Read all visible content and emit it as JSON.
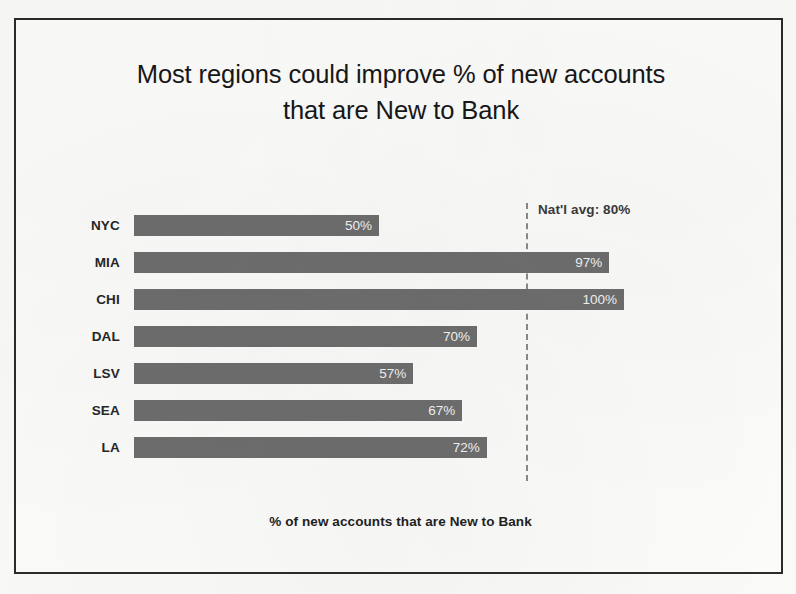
{
  "slide": {
    "title_line1": "Most regions could improve % of new accounts",
    "title_line2": "that are New to Bank",
    "frame_color": "#2b2b2b",
    "background_color": "#fdfdfc"
  },
  "annotation": {
    "avg_label": "Nat'l avg: 80%",
    "avg_value": 80,
    "line_style": "dashed",
    "line_color": "#8a8a8a"
  },
  "chart_data": {
    "type": "bar",
    "orientation": "horizontal",
    "title": "Most regions could improve % of new accounts that are New to Bank",
    "xlabel": "% of new accounts that are New to Bank",
    "ylabel": "",
    "categories": [
      "NYC",
      "MIA",
      "CHI",
      "DAL",
      "LSV",
      "SEA",
      "LA"
    ],
    "values": [
      50,
      97,
      100,
      70,
      57,
      67,
      72
    ],
    "value_labels": [
      "50%",
      "97%",
      "100%",
      "70%",
      "57%",
      "67%",
      "72%"
    ],
    "xlim": [
      0,
      100
    ],
    "grid": false,
    "legend": null,
    "bar_color": "#6e6e6e",
    "value_label_color": "#f4f4f4",
    "annotations": [
      {
        "type": "reference-line",
        "label": "Nat'l avg: 80%",
        "value": 80,
        "style": "dashed"
      }
    ]
  }
}
